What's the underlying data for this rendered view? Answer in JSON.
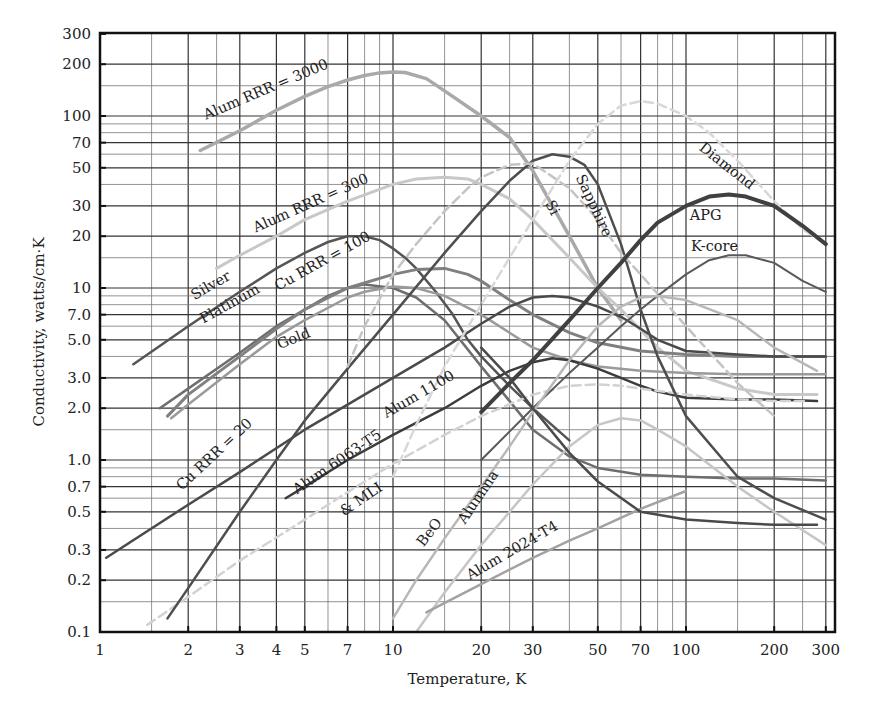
{
  "chart_data": {
    "type": "line",
    "title": "",
    "xlabel": "Temperature, K",
    "ylabel": "Conductivity, watts/cm·K",
    "xscale": "log",
    "yscale": "log",
    "xlim": [
      1,
      400
    ],
    "ylim": [
      0.1,
      300
    ],
    "grid": true,
    "legend": "inline labels",
    "x_ticks": [
      1,
      2,
      3,
      4,
      5,
      7,
      10,
      20,
      30,
      50,
      70,
      100,
      200,
      300
    ],
    "x_tick_labels": [
      "1",
      "2",
      "3",
      "4",
      "5",
      "7",
      "10",
      "20",
      "30",
      "50",
      "70",
      "100",
      "200",
      "300"
    ],
    "y_ticks": [
      0.1,
      0.2,
      0.3,
      0.5,
      0.7,
      1.0,
      2.0,
      3.0,
      5.0,
      7.0,
      10,
      20,
      30,
      50,
      70,
      100,
      200,
      300
    ],
    "y_tick_labels": [
      "0.1",
      "0.2",
      "0.3",
      "0.5",
      "0.7",
      "1.0",
      "2.0",
      "3.0",
      "5.0",
      "7.0",
      "10",
      "20",
      "30",
      "50",
      "70",
      "100",
      "200",
      "300"
    ],
    "x_grid": [
      1.5,
      2,
      2.5,
      3,
      4,
      5,
      6,
      7,
      8,
      9,
      10,
      15,
      20,
      25,
      30,
      40,
      50,
      60,
      70,
      80,
      90,
      100,
      150,
      200,
      250,
      300
    ],
    "y_grid": [
      0.15,
      0.2,
      0.3,
      0.4,
      0.5,
      0.6,
      0.7,
      0.8,
      0.9,
      1.0,
      1.5,
      2,
      3,
      4,
      5,
      6,
      7,
      8,
      9,
      10,
      15,
      20,
      30,
      40,
      50,
      60,
      70,
      80,
      90,
      100,
      150,
      200
    ],
    "series": [
      {
        "name": "Alum RRR = 3000",
        "color": "#a9a9a9",
        "width": 3.5,
        "dash": "",
        "x": [
          2.2,
          3,
          4,
          5,
          6,
          7,
          8,
          9,
          10,
          11,
          13,
          15,
          20,
          25,
          30,
          40,
          50,
          60
        ],
        "y": [
          63,
          82,
          108,
          130,
          148,
          162,
          172,
          178,
          180,
          179,
          165,
          140,
          100,
          75,
          48,
          20,
          10,
          6.5
        ]
      },
      {
        "name": "Alum RRR = 300",
        "color": "#c8c8c8",
        "width": 3,
        "dash": "",
        "x": [
          2.5,
          3,
          4,
          5,
          7,
          10,
          12,
          15,
          18,
          20,
          25,
          30,
          40,
          50,
          60,
          80,
          100,
          150,
          200,
          280
        ],
        "y": [
          13,
          15.5,
          20,
          25,
          32,
          40,
          43,
          44,
          43,
          40,
          33,
          25,
          15,
          10,
          7.5,
          4.5,
          3.3,
          2.6,
          2.4,
          2.4
        ]
      },
      {
        "name": "Silver",
        "color": "#555555",
        "width": 2.5,
        "dash": "",
        "x": [
          1.3,
          2,
          3,
          4,
          5,
          6,
          7,
          8,
          9,
          10,
          11,
          12,
          14,
          16,
          18,
          20,
          25,
          30,
          40
        ],
        "y": [
          3.6,
          6,
          9.5,
          13,
          16,
          18.5,
          20,
          20,
          19,
          17,
          15,
          13,
          9.5,
          7,
          5,
          4,
          2.7,
          2,
          1.3
        ]
      },
      {
        "name": "Platinum",
        "color": "#6e6e6e",
        "width": 2.5,
        "dash": "",
        "x": [
          1.6,
          2,
          3,
          4,
          5,
          6,
          7,
          8,
          10,
          12,
          15,
          20,
          25,
          30,
          40,
          50,
          70,
          100,
          150,
          200,
          300
        ],
        "y": [
          2,
          2.6,
          4.2,
          6,
          7.5,
          9,
          10,
          10.5,
          10,
          8.8,
          6.5,
          3.5,
          2.2,
          1.5,
          1.05,
          0.9,
          0.82,
          0.8,
          0.78,
          0.78,
          0.76
        ]
      },
      {
        "name": "Cu RRR = 100",
        "color": "#808080",
        "width": 3,
        "dash": "",
        "x": [
          1.7,
          2,
          3,
          4,
          5,
          7,
          10,
          12,
          15,
          18,
          20,
          25,
          30,
          40,
          50,
          70,
          100,
          150,
          200,
          300
        ],
        "y": [
          1.8,
          2.4,
          4,
          5.8,
          7.5,
          10,
          12,
          12.8,
          13,
          12,
          11,
          8.5,
          7,
          5.5,
          4.8,
          4.3,
          4.1,
          4.0,
          4.0,
          4.0
        ]
      },
      {
        "name": "Gold",
        "color": "#9a9a9a",
        "width": 2.5,
        "dash": "",
        "x": [
          1.75,
          2,
          3,
          4,
          5,
          7,
          8,
          10,
          12,
          15,
          20,
          25,
          30,
          40,
          50,
          70,
          100,
          150,
          200,
          300
        ],
        "y": [
          1.75,
          2.1,
          3.6,
          5.2,
          6.5,
          8.8,
          9.5,
          10.2,
          10,
          9,
          7,
          5.5,
          4.5,
          3.8,
          3.5,
          3.3,
          3.2,
          3.15,
          3.15,
          3.15
        ]
      },
      {
        "name": "Cu RRR = 20",
        "color": "#4a4a4a",
        "width": 2.5,
        "dash": "",
        "x": [
          1.05,
          2,
          3,
          5,
          7,
          10,
          15,
          20,
          25,
          30,
          35,
          40,
          50,
          60,
          70,
          80,
          100,
          150,
          200,
          300
        ],
        "y": [
          0.27,
          0.55,
          0.85,
          1.5,
          2.1,
          3,
          4.5,
          6.2,
          7.8,
          8.8,
          9,
          8.8,
          7.8,
          6.8,
          5.8,
          5.0,
          4.3,
          4.1,
          4.0,
          4.0
        ]
      },
      {
        "name": "Alum 1100",
        "color": "#3c3c3c",
        "width": 2.5,
        "dash": "",
        "x": [
          4.3,
          5,
          7,
          10,
          15,
          20,
          25,
          30,
          35,
          40,
          50,
          60,
          70,
          80,
          100,
          150,
          200,
          280
        ],
        "y": [
          0.6,
          0.7,
          1.0,
          1.4,
          2.0,
          2.7,
          3.3,
          3.7,
          3.9,
          3.8,
          3.4,
          3.0,
          2.7,
          2.5,
          2.3,
          2.25,
          2.25,
          2.2
        ]
      },
      {
        "name": "Alum 6063-T5 & MLI",
        "color": "#d2d2d2",
        "width": 2.5,
        "dash": "9,5",
        "x": [
          1.45,
          2,
          3,
          5,
          7,
          10,
          15,
          20,
          30,
          40,
          50,
          60,
          70,
          100,
          150,
          200,
          260
        ],
        "y": [
          0.11,
          0.16,
          0.26,
          0.45,
          0.65,
          0.95,
          1.4,
          1.8,
          2.4,
          2.7,
          2.75,
          2.7,
          2.6,
          2.4,
          2.25,
          2.2,
          2.2
        ]
      },
      {
        "name": "Sapphire",
        "color": "#4e4e4e",
        "width": 2.5,
        "dash": "",
        "x": [
          1.7,
          2,
          3,
          4,
          5,
          7,
          10,
          15,
          20,
          25,
          30,
          35,
          40,
          45,
          50,
          60,
          70,
          80,
          100,
          150,
          200,
          300
        ],
        "y": [
          0.12,
          0.18,
          0.5,
          1.0,
          1.7,
          3.4,
          7.0,
          16,
          28,
          42,
          55,
          60,
          58,
          52,
          40,
          18,
          7.5,
          4.0,
          1.8,
          0.8,
          0.6,
          0.45
        ]
      },
      {
        "name": "Si",
        "color": "#c4c4c4",
        "width": 2.5,
        "dash": "9,5",
        "x": [
          7,
          8,
          10,
          12,
          15,
          18,
          20,
          25,
          30,
          40,
          50,
          60,
          70,
          100,
          150,
          200
        ],
        "y": [
          3.5,
          6,
          12,
          18,
          28,
          38,
          44,
          52,
          53,
          38,
          25,
          16,
          12,
          6,
          2.8,
          1.8
        ]
      },
      {
        "name": "Diamond",
        "color": "#d8d8d8",
        "width": 2.5,
        "dash": "9,5",
        "x": [
          10,
          12,
          15,
          20,
          25,
          30,
          40,
          50,
          60,
          70,
          80,
          100,
          120,
          150,
          200,
          250,
          300
        ],
        "y": [
          0.8,
          1.6,
          3.5,
          8,
          15,
          25,
          55,
          90,
          115,
          122,
          118,
          100,
          80,
          55,
          32,
          22,
          18
        ]
      },
      {
        "name": "APG",
        "color": "#404040",
        "width": 4,
        "dash": "",
        "x": [
          20,
          25,
          30,
          40,
          50,
          60,
          70,
          80,
          100,
          120,
          140,
          160,
          200,
          250,
          300
        ],
        "y": [
          1.9,
          2.8,
          3.8,
          6.5,
          10,
          14,
          19,
          24,
          30,
          34,
          35,
          34,
          30,
          23,
          18
        ]
      },
      {
        "name": "K-core",
        "color": "#595959",
        "width": 2,
        "dash": "",
        "x": [
          20,
          30,
          40,
          50,
          60,
          70,
          80,
          100,
          120,
          140,
          160,
          200,
          250,
          300
        ],
        "y": [
          1.0,
          2.0,
          3.2,
          4.5,
          6,
          7.5,
          9,
          12,
          14.5,
          15.5,
          15.5,
          14,
          11,
          9.5
        ]
      },
      {
        "name": "BeO",
        "color": "#b8b8b8",
        "width": 2.5,
        "dash": "",
        "x": [
          10,
          12,
          15,
          20,
          25,
          30,
          40,
          50,
          60,
          70,
          80,
          100,
          150,
          200,
          280
        ],
        "y": [
          0.12,
          0.2,
          0.35,
          0.7,
          1.2,
          1.9,
          3.8,
          6.0,
          7.8,
          8.8,
          9.0,
          8.5,
          6.5,
          4.5,
          3.3
        ]
      },
      {
        "name": "Alumina",
        "color": "#c6c6c6",
        "width": 2.5,
        "dash": "",
        "x": [
          12,
          15,
          20,
          25,
          30,
          40,
          50,
          60,
          70,
          80,
          100,
          150,
          200,
          300
        ],
        "y": [
          0.1,
          0.17,
          0.32,
          0.5,
          0.72,
          1.2,
          1.6,
          1.75,
          1.7,
          1.5,
          1.2,
          0.7,
          0.5,
          0.32
        ]
      },
      {
        "name": "Alum 2024-T4",
        "color": "#a2a2a2",
        "width": 2.5,
        "dash": "",
        "x": [
          13,
          20,
          30,
          40,
          50,
          70,
          100
        ],
        "y": [
          0.13,
          0.19,
          0.27,
          0.34,
          0.4,
          0.52,
          0.66
        ]
      },
      {
        "name": "Cu RRR = 20 (low-T tail)",
        "color": "#4a4a4a",
        "width": 2.5,
        "dash": "",
        "x": [
          20,
          25,
          30,
          40,
          50,
          70,
          100,
          150,
          200,
          280
        ],
        "y": [
          4.5,
          3,
          2.0,
          1.1,
          0.75,
          0.5,
          0.45,
          0.43,
          0.42,
          0.42
        ]
      }
    ],
    "annotations": [
      {
        "text": "Alum RRR = 3000",
        "T": 2.3,
        "k": 95,
        "angle": -23
      },
      {
        "text": "Alum RRR = 300",
        "T": 3.4,
        "k": 21,
        "angle": -24
      },
      {
        "text": "Silver",
        "T": 2.1,
        "k": 8.5,
        "angle": -30
      },
      {
        "text": "Platinum",
        "T": 2.25,
        "k": 6.2,
        "angle": -29
      },
      {
        "text": "Cu RRR = 100",
        "T": 4.05,
        "k": 9.6,
        "angle": -29
      },
      {
        "text": "Gold",
        "T": 4.1,
        "k": 4.4,
        "angle": -22
      },
      {
        "text": "Cu RRR = 20",
        "T": 1.9,
        "k": 0.66,
        "angle": -43
      },
      {
        "text": "Alum 1100",
        "T": 9.5,
        "k": 1.75,
        "angle": -30
      },
      {
        "text": "Alum 6063-T5",
        "T": 4.7,
        "k": 0.63,
        "angle": -34
      },
      {
        "text": "& MLI",
        "T": 6.8,
        "k": 0.47,
        "angle": -34
      },
      {
        "text": "BeO",
        "T": 12.7,
        "k": 0.31,
        "angle": -52
      },
      {
        "text": "Alumina",
        "T": 17.6,
        "k": 0.42,
        "angle": -56
      },
      {
        "text": "Alum 2024-T4",
        "T": 18.3,
        "k": 0.2,
        "angle": -30
      },
      {
        "text": "Si",
        "T": 33,
        "k": 31,
        "angle": 62
      },
      {
        "text": "Sapphire",
        "T": 42,
        "k": 44,
        "angle": 65
      },
      {
        "text": "Diamond",
        "T": 110,
        "k": 64,
        "angle": 38
      },
      {
        "text": "APG",
        "T": 103,
        "k": 25,
        "angle": 0
      },
      {
        "text": "K-core",
        "T": 104,
        "k": 16.5,
        "angle": 0
      }
    ],
    "frame": {
      "left_px": 100,
      "top_px": 33,
      "right_px": 835,
      "bottom_px": 632,
      "x_decade_px": 293,
      "y_decade_px": 172,
      "y_at_k1_px": 460
    }
  }
}
